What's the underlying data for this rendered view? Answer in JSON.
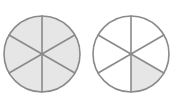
{
  "figure": {
    "background_color": "#ffffff",
    "stroke_color": "#8a8a8a",
    "shaded_fill_color": "#e6e6e6",
    "empty_fill_color": "#ffffff",
    "stroke_width": 1.6,
    "spoke_width": 1.6,
    "sector_count": 6,
    "circles": [
      {
        "id": "circle-left",
        "label": "Left circle",
        "center_x": 42,
        "center_y": 54,
        "radius": 38,
        "sectors_total": 6,
        "sectors_shaded": 6,
        "fraction_text": "6/6",
        "shaded_indices": [
          0,
          1,
          2,
          3,
          4,
          5
        ]
      },
      {
        "id": "circle-right",
        "label": "Right circle",
        "center_x": 131,
        "center_y": 54,
        "radius": 38,
        "sectors_total": 6,
        "sectors_shaded": 1,
        "fraction_text": "1/6",
        "shaded_indices": [
          2
        ]
      }
    ],
    "sector_start_angle_deg": -90,
    "sector_sweep_deg": 60
  }
}
